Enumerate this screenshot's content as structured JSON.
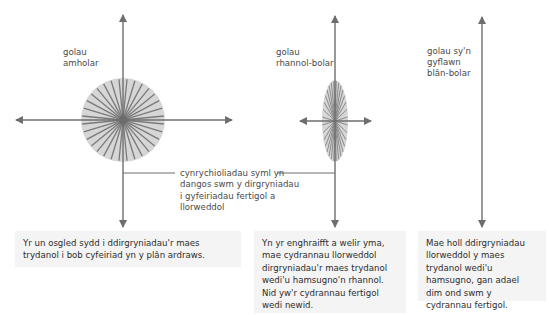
{
  "colors": {
    "axis": "#6e6e6e",
    "disc_fill": "#d6d6d6",
    "rays": "#7a7a7a",
    "box_bg": "#f4f4f4",
    "text": "#2c2c2c"
  },
  "diagrams": [
    {
      "id": "unpolarized",
      "label": "golau\namholar",
      "shape": "circle",
      "caption": "Yr un osgled sydd i ddirgryniadau'r maes trydanol i bob cyfeiriad yn y plân ardraws."
    },
    {
      "id": "partially-polarized",
      "label": "golau\nrhannol-bolar",
      "shape": "ellipse",
      "caption": "Yn yr enghraifft a welir yma, mae cydrannau llorweddol dirgryniadau'r maes trydanol wedi'u hamsugno'n rhannol. Nid yw'r cydrannau fertigol wedi newid."
    },
    {
      "id": "fully-polarized",
      "label": "golau sy'n\ngyflawn\nblân-bolar",
      "shape": "line",
      "caption": "Mae holl ddirgryniadau llorweddol y maes trydanol wedi'u hamsugno, gan adael dim ond swm y cydrannau fertigol."
    }
  ],
  "annotation": {
    "text": "cynrychioliadau syml yn\ndangos swm y dirgryniadau\ni gyfeiriadau fertigol a\nllorweddol"
  }
}
